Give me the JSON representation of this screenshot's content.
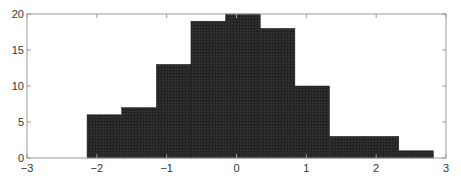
{
  "chart_data": {
    "type": "bar",
    "subtype": "histogram",
    "title": "",
    "xlabel": "",
    "ylabel": "",
    "bin_edges": [
      -2.14,
      -1.644,
      -1.148,
      -0.652,
      -0.156,
      0.34,
      0.836,
      1.332,
      1.828,
      2.324,
      2.82
    ],
    "categories": [
      "-2.14 to -1.64",
      "-1.64 to -1.15",
      "-1.15 to -0.65",
      "-0.65 to -0.16",
      "-0.16 to 0.34",
      "0.34 to 0.84",
      "0.84 to 1.33",
      "1.33 to 1.83",
      "1.83 to 2.32",
      "2.32 to 2.82"
    ],
    "values": [
      6,
      7,
      13,
      19,
      20,
      18,
      10,
      3,
      3,
      1
    ],
    "xlim": [
      -3,
      3
    ],
    "ylim": [
      0,
      20
    ],
    "xticks": [
      -3,
      -2,
      -1,
      0,
      1,
      2,
      3
    ],
    "xtick_labels": [
      "−3",
      "−2",
      "−1",
      "0",
      "1",
      "2",
      "3"
    ],
    "yticks": [
      0,
      5,
      10,
      15,
      20
    ],
    "ytick_labels": [
      "0",
      "5",
      "10",
      "15",
      "20"
    ],
    "grid": false,
    "legend": null,
    "bar_color": "#222222",
    "axis_color": "#999999"
  }
}
